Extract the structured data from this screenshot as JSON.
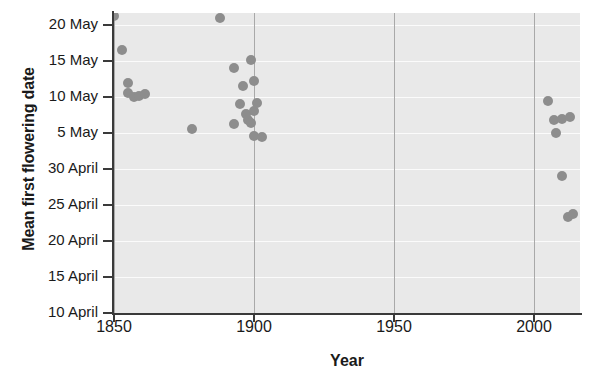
{
  "chart_data": {
    "type": "scatter",
    "title": "",
    "xlabel": "Year",
    "ylabel": "Mean first flowering date",
    "xlim": [
      1845,
      2018
    ],
    "ylim": [
      0,
      40
    ],
    "grid": true,
    "legend": null,
    "point_color": "#8d8d8d",
    "plot_background": "#e9e9e9",
    "xticks": [
      {
        "value": 1850,
        "label": "1850"
      },
      {
        "value": 1900,
        "label": "1900"
      },
      {
        "value": 1950,
        "label": "1950"
      },
      {
        "value": 2000,
        "label": "2000"
      }
    ],
    "yticks": [
      {
        "value": 40,
        "label": "20 May"
      },
      {
        "value": 35,
        "label": "15 May"
      },
      {
        "value": 30,
        "label": "10 May"
      },
      {
        "value": 25,
        "label": "5 May"
      },
      {
        "value": 20,
        "label": "30 April"
      },
      {
        "value": 15,
        "label": "25 April"
      },
      {
        "value": 10,
        "label": "20 April"
      },
      {
        "value": 5,
        "label": "15 April"
      },
      {
        "value": 0,
        "label": "10 April"
      }
    ],
    "y_axis_note": "y value = days since 10 April; 30 = 10 May, 40 = 20 May",
    "points": [
      {
        "x": 1850,
        "y": 41.2,
        "date": "21 May"
      },
      {
        "x": 1853,
        "y": 36.5,
        "date": "16 May"
      },
      {
        "x": 1855,
        "y": 32.0,
        "date": "12 May"
      },
      {
        "x": 1855,
        "y": 30.6,
        "date": "11 May"
      },
      {
        "x": 1857,
        "y": 30.0,
        "date": "10 May"
      },
      {
        "x": 1859,
        "y": 30.2,
        "date": "10 May"
      },
      {
        "x": 1861,
        "y": 30.4,
        "date": "10 May"
      },
      {
        "x": 1878,
        "y": 25.5,
        "date": "5 May"
      },
      {
        "x": 1888,
        "y": 41.0,
        "date": "21 May"
      },
      {
        "x": 1893,
        "y": 34.0,
        "date": "14 May"
      },
      {
        "x": 1896,
        "y": 31.5,
        "date": "11 May"
      },
      {
        "x": 1899,
        "y": 35.2,
        "date": "15 May"
      },
      {
        "x": 1900,
        "y": 32.2,
        "date": "12 May"
      },
      {
        "x": 1895,
        "y": 29.0,
        "date": "9 May"
      },
      {
        "x": 1897,
        "y": 27.6,
        "date": "7 May"
      },
      {
        "x": 1898,
        "y": 26.8,
        "date": "7 May"
      },
      {
        "x": 1899,
        "y": 26.4,
        "date": "6 May"
      },
      {
        "x": 1900,
        "y": 28.0,
        "date": "8 May"
      },
      {
        "x": 1901,
        "y": 29.2,
        "date": "9 May"
      },
      {
        "x": 1893,
        "y": 26.2,
        "date": "6 May"
      },
      {
        "x": 1900,
        "y": 24.6,
        "date": "5 May"
      },
      {
        "x": 1903,
        "y": 24.4,
        "date": "4 May"
      },
      {
        "x": 2005,
        "y": 29.4,
        "date": "9 May"
      },
      {
        "x": 2007,
        "y": 26.8,
        "date": "7 May"
      },
      {
        "x": 2010,
        "y": 27.0,
        "date": "7 May"
      },
      {
        "x": 2013,
        "y": 27.2,
        "date": "7 May"
      },
      {
        "x": 2008,
        "y": 25.0,
        "date": "5 May"
      },
      {
        "x": 2010,
        "y": 19.0,
        "date": "29 April"
      },
      {
        "x": 2012,
        "y": 13.4,
        "date": "23 April"
      },
      {
        "x": 2014,
        "y": 13.8,
        "date": "24 April"
      }
    ]
  }
}
